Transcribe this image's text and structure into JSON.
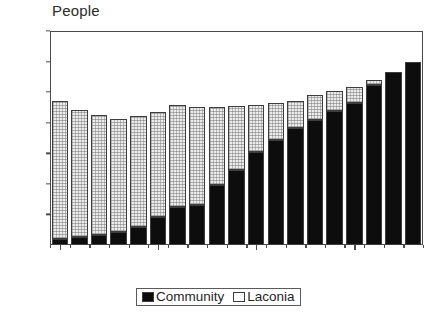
{
  "chart_data": {
    "type": "bar",
    "subtype": "stacked-bar",
    "title": "",
    "ylabel": "People",
    "xlabel": "",
    "ylim": [
      0,
      1400
    ],
    "yticks": [
      0,
      200,
      400,
      600,
      800,
      1000,
      1200,
      1400
    ],
    "grid": false,
    "legend_position": "bottom-center",
    "x": [
      1975,
      1976,
      1977,
      1978,
      1979,
      1980,
      1981,
      1982,
      1983,
      1984,
      1985,
      1986,
      1987,
      1988,
      1989,
      1990,
      1991,
      1992,
      1993
    ],
    "categories": [
      "1975",
      "1976",
      "1977",
      "1978",
      "1979",
      "1980",
      "1981",
      "1982",
      "1983",
      "1984",
      "1985",
      "1986",
      "1987",
      "1988",
      "1989",
      "1990",
      "1991",
      "1992",
      "1993"
    ],
    "xtick_labels": [
      "1975",
      "1980",
      "1985",
      "1990"
    ],
    "xtick_values": [
      1975,
      1980,
      1985,
      1990
    ],
    "series": [
      {
        "name": "Community",
        "color": "#0d0d0d",
        "values": [
          40,
          55,
          65,
          85,
          120,
          185,
          250,
          265,
          390,
          490,
          610,
          690,
          765,
          815,
          880,
          930,
          1050,
          1130,
          1200
        ]
      },
      {
        "name": "Laconia",
        "color": "#ececec",
        "values": [
          895,
          820,
          780,
          735,
          715,
          680,
          660,
          630,
          505,
          415,
          300,
          230,
          170,
          160,
          120,
          100,
          20,
          0,
          0
        ]
      }
    ],
    "totals": [
      935,
      875,
      845,
      820,
      835,
      865,
      910,
      895,
      895,
      905,
      910,
      920,
      935,
      975,
      1000,
      1030,
      1070,
      1130,
      1200
    ]
  },
  "legend": {
    "entries": [
      {
        "label": "Community",
        "swatch": "filled-black-swatch"
      },
      {
        "label": "Laconia",
        "swatch": "empty-white-swatch"
      }
    ]
  }
}
